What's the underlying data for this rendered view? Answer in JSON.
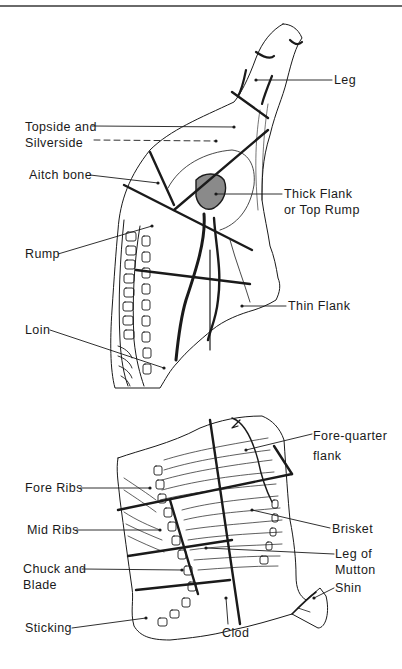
{
  "diagram": {
    "hind_quarter": {
      "labels": [
        {
          "id": "leg",
          "lines": [
            "Leg"
          ]
        },
        {
          "id": "topside",
          "lines": [
            "Topside and",
            "Silverside"
          ]
        },
        {
          "id": "aitch",
          "lines": [
            "Aitch bone"
          ]
        },
        {
          "id": "thick-flank",
          "lines": [
            "Thick Flank",
            "or Top Rump"
          ]
        },
        {
          "id": "rump",
          "lines": [
            "Rump"
          ]
        },
        {
          "id": "thin-flank",
          "lines": [
            "Thin Flank"
          ]
        },
        {
          "id": "loin",
          "lines": [
            "Loin"
          ]
        }
      ]
    },
    "fore_quarter": {
      "labels": [
        {
          "id": "fq-flank",
          "lines": [
            "Fore-quarter",
            "flank"
          ]
        },
        {
          "id": "fore-ribs",
          "lines": [
            "Fore Ribs"
          ]
        },
        {
          "id": "mid-ribs",
          "lines": [
            "Mid Ribs"
          ]
        },
        {
          "id": "brisket",
          "lines": [
            "Brisket"
          ]
        },
        {
          "id": "chuck",
          "lines": [
            "Chuck and",
            "Blade"
          ]
        },
        {
          "id": "leg-mutton",
          "lines": [
            "Leg of",
            "Mutton"
          ]
        },
        {
          "id": "shin",
          "lines": [
            "Shin"
          ]
        },
        {
          "id": "sticking",
          "lines": [
            "Sticking"
          ]
        },
        {
          "id": "clod",
          "lines": [
            "Clod"
          ]
        }
      ]
    },
    "colors": {
      "ink": "#1a1a1a",
      "paper": "#ffffff",
      "rule": "#6a6a6a"
    }
  }
}
